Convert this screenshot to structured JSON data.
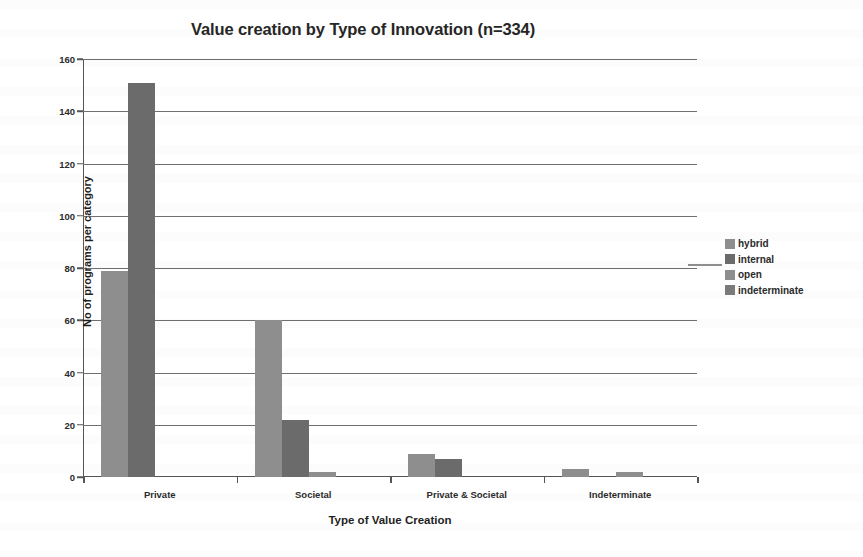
{
  "chart_data": {
    "type": "bar",
    "title": "Value creation by Type of Innovation (n=334)",
    "xlabel": "Type of Value Creation",
    "ylabel": "No of programs per category",
    "categories": [
      "Private",
      "Societal",
      "Private & Societal",
      "Indeterminate"
    ],
    "series": [
      {
        "name": "hybrid",
        "color": "#8e8e8e",
        "values": [
          79,
          60,
          9,
          3
        ]
      },
      {
        "name": "internal",
        "color": "#6b6b6b",
        "values": [
          151,
          22,
          7,
          0
        ]
      },
      {
        "name": "open",
        "color": "#8e8e8e",
        "values": [
          0,
          2,
          0,
          2
        ]
      },
      {
        "name": "indeterminate",
        "color": "#7a7a7a",
        "values": [
          0,
          0,
          0,
          0
        ]
      }
    ],
    "ylim": [
      0,
      160
    ],
    "yticks": [
      0,
      20,
      40,
      60,
      80,
      100,
      120,
      140,
      160
    ],
    "ytick_labels": [
      "0",
      "20",
      "40",
      "60",
      "80",
      "100",
      "120",
      "140",
      "160"
    ],
    "grid": true,
    "legend_position": "right",
    "legend_entries": [
      "hybrid",
      "internal",
      "open",
      "indeterminate"
    ],
    "sample_size": "n=334"
  }
}
